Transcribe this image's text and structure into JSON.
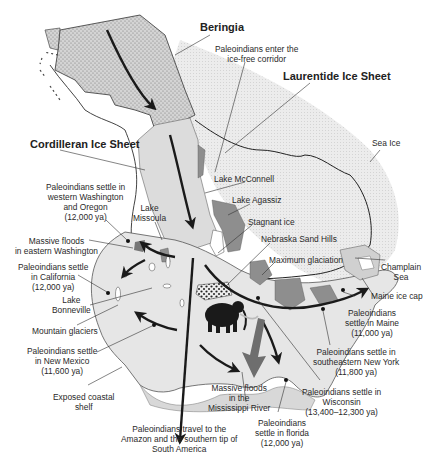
{
  "map": {
    "title": "Peopling of North America during the last glaciation",
    "colors": {
      "ice_sheet_fill": "#e4e4e4",
      "beringia_fill": "#d6d6d6",
      "land_fill": "#e8e8e8",
      "lakes_fill": "#8c8c8c",
      "ocean": "#ffffff",
      "arrow": "#1a1a1a",
      "flood_arrow": "#6e6e6e"
    },
    "region_labels": {
      "beringia": "Beringia",
      "laurentide": "Laurentide Ice Sheet",
      "cordilleran": "Cordilleran Ice Sheet",
      "sea_ice": "Sea Ice"
    },
    "labels": {
      "ice_free_corridor": [
        "Paleoindians enter the",
        "ice-free corridor"
      ],
      "lake_mcconnell": "Lake McConnell",
      "lake_agassiz": "Lake Agassiz",
      "stagnant_ice": "Stagnant ice",
      "nebraska_sand_hills": "Nebraska Sand Hills",
      "maximum_glaciation": "Maximum glaciation",
      "champlain_sea": [
        "Champlain",
        "Sea"
      ],
      "maine_ice_cap": "Maine ice cap",
      "washington_oregon": [
        "Paleoindians settle in",
        "western Washington",
        "and Oregon",
        "(12,000 ya)"
      ],
      "lake_missoula": [
        "Lake",
        "Missoula"
      ],
      "floods_washington": [
        "Massive floods",
        "in eastern Washington"
      ],
      "california": [
        "Paleoindians settle",
        "in California",
        "(12,000 ya)"
      ],
      "lake_bonneville": [
        "Lake",
        "Bonneville"
      ],
      "mountain_glaciers": "Mountain glaciers",
      "new_mexico": [
        "Paleoindians settle",
        "in New Mexico",
        "(11,600 ya)"
      ],
      "coastal_shelf": [
        "Exposed coastal",
        "shelf"
      ],
      "south_america": [
        "Paleoindians travel to the",
        "Amazon and the southern tip of",
        "South America"
      ],
      "mississippi_floods": [
        "Massive floods",
        "in the",
        "Mississippi River"
      ],
      "florida": [
        "Paleoindians",
        "settle in florida",
        "(12,000 ya)"
      ],
      "wisconsin": [
        "Paleoindians settle in",
        "Wisconsin",
        "(13,400–12,300 ya)"
      ],
      "new_york": [
        "Paleoindians settle in",
        "southeastern New York",
        "(11,800 ya)"
      ],
      "maine": [
        "Paleoindians",
        "settle in Maine",
        "(11,000 ya)"
      ]
    },
    "icons": {
      "mammoth": "mammoth-silhouette-icon",
      "migration_arrow": "arrow-icon",
      "settlement_site": "dot-marker-icon"
    }
  }
}
